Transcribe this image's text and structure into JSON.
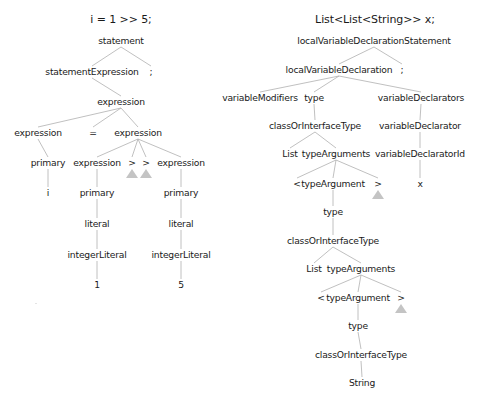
{
  "left_tree": {
    "title": "i = 1 >> 5;",
    "nodes": [
      {
        "id": "L0",
        "label": "statement"
      },
      {
        "id": "L1",
        "label": "statementExpression"
      },
      {
        "id": "L2",
        "label": ";"
      },
      {
        "id": "L3",
        "label": "expression"
      },
      {
        "id": "L4",
        "label": "expression"
      },
      {
        "id": "L5",
        "label": "="
      },
      {
        "id": "L6",
        "label": "expression"
      },
      {
        "id": "L7",
        "label": "primary"
      },
      {
        "id": "L8",
        "label": "expression"
      },
      {
        "id": "L9",
        "label": ">"
      },
      {
        "id": "L10",
        "label": ">"
      },
      {
        "id": "L11",
        "label": "expression"
      },
      {
        "id": "L12",
        "label": "i"
      },
      {
        "id": "L13",
        "label": "primary"
      },
      {
        "id": "L14",
        "label": "primary"
      },
      {
        "id": "L15",
        "label": "literal"
      },
      {
        "id": "L16",
        "label": "literal"
      },
      {
        "id": "L17",
        "label": "integerLiteral"
      },
      {
        "id": "L18",
        "label": "integerLiteral"
      },
      {
        "id": "L19",
        "label": "1"
      },
      {
        "id": "L20",
        "label": "5"
      }
    ],
    "edges": [
      [
        "L0",
        "L1"
      ],
      [
        "L0",
        "L2"
      ],
      [
        "L1",
        "L3"
      ],
      [
        "L3",
        "L4"
      ],
      [
        "L3",
        "L5"
      ],
      [
        "L3",
        "L6"
      ],
      [
        "L4",
        "L7"
      ],
      [
        "L6",
        "L8"
      ],
      [
        "L6",
        "L9"
      ],
      [
        "L6",
        "L10"
      ],
      [
        "L6",
        "L11"
      ],
      [
        "L7",
        "L12"
      ],
      [
        "L8",
        "L13"
      ],
      [
        "L11",
        "L14"
      ],
      [
        "L13",
        "L15"
      ],
      [
        "L14",
        "L16"
      ],
      [
        "L15",
        "L17"
      ],
      [
        "L16",
        "L18"
      ],
      [
        "L17",
        "L19"
      ],
      [
        "L18",
        "L20"
      ]
    ],
    "markers": [
      "L9",
      "L10"
    ]
  },
  "right_tree": {
    "title": "List<List<String>> x;",
    "nodes": [
      {
        "id": "R0",
        "label": "localVariableDeclarationStatement"
      },
      {
        "id": "R1",
        "label": "localVariableDeclaration"
      },
      {
        "id": "R2",
        "label": ";"
      },
      {
        "id": "R3",
        "label": "variableModifiers"
      },
      {
        "id": "R4",
        "label": "type"
      },
      {
        "id": "R5",
        "label": "variableDeclarators"
      },
      {
        "id": "R6",
        "label": "classOrInterfaceType"
      },
      {
        "id": "R7",
        "label": "variableDeclarator"
      },
      {
        "id": "R8",
        "label": "List"
      },
      {
        "id": "R9",
        "label": "typeArguments"
      },
      {
        "id": "R10",
        "label": "variableDeclaratorId"
      },
      {
        "id": "R11",
        "label": "<"
      },
      {
        "id": "R12",
        "label": "typeArgument"
      },
      {
        "id": "R13",
        "label": ">"
      },
      {
        "id": "R14",
        "label": "x"
      },
      {
        "id": "R15",
        "label": "type"
      },
      {
        "id": "R16",
        "label": "classOrInterfaceType"
      },
      {
        "id": "R17",
        "label": "List"
      },
      {
        "id": "R18",
        "label": "typeArguments"
      },
      {
        "id": "R19",
        "label": "<"
      },
      {
        "id": "R20",
        "label": "typeArgument"
      },
      {
        "id": "R21",
        "label": ">"
      },
      {
        "id": "R22",
        "label": "type"
      },
      {
        "id": "R23",
        "label": "classOrInterfaceType"
      },
      {
        "id": "R24",
        "label": "String"
      }
    ],
    "edges": [
      [
        "R0",
        "R1"
      ],
      [
        "R0",
        "R2"
      ],
      [
        "R1",
        "R3"
      ],
      [
        "R1",
        "R4"
      ],
      [
        "R1",
        "R5"
      ],
      [
        "R4",
        "R6"
      ],
      [
        "R5",
        "R7"
      ],
      [
        "R6",
        "R8"
      ],
      [
        "R6",
        "R9"
      ],
      [
        "R7",
        "R10"
      ],
      [
        "R9",
        "R11"
      ],
      [
        "R9",
        "R12"
      ],
      [
        "R9",
        "R13"
      ],
      [
        "R10",
        "R14"
      ],
      [
        "R12",
        "R15"
      ],
      [
        "R15",
        "R16"
      ],
      [
        "R16",
        "R17"
      ],
      [
        "R16",
        "R18"
      ],
      [
        "R18",
        "R19"
      ],
      [
        "R18",
        "R20"
      ],
      [
        "R18",
        "R21"
      ],
      [
        "R20",
        "R22"
      ],
      [
        "R22",
        "R23"
      ],
      [
        "R23",
        "R24"
      ]
    ],
    "markers": [
      "R13",
      "R21"
    ]
  },
  "colors": {
    "text": "#1a1a1a",
    "edge": "#b0b0b0",
    "marker": "#c4c4c4",
    "background": "#ffffff"
  }
}
